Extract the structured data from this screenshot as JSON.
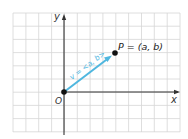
{
  "figure": {
    "type": "vector-diagram",
    "grid": {
      "left": 13,
      "top": 13,
      "right": 180,
      "bottom": 132,
      "step_x": 12.85,
      "step_y": 13.2,
      "color": "#d6d6d6"
    },
    "axes": {
      "origin_px": [
        64,
        92
      ],
      "x_label": "x",
      "y_label": "y",
      "origin_label": "O",
      "color": "#333333"
    },
    "vector": {
      "label": "v = <a, b>",
      "color": "#4fb7df",
      "from_px": [
        64,
        92
      ],
      "to_px": [
        115,
        53
      ]
    },
    "point": {
      "label": "P = (a, b)",
      "px": [
        115,
        53
      ]
    }
  }
}
